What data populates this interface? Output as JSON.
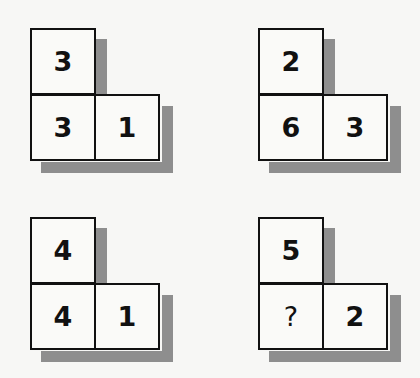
{
  "puzzle": {
    "figures": [
      {
        "top": "3",
        "bottom_left": "3",
        "bottom_right": "1"
      },
      {
        "top": "2",
        "bottom_left": "6",
        "bottom_right": "3"
      },
      {
        "top": "4",
        "bottom_left": "4",
        "bottom_right": "1"
      },
      {
        "top": "5",
        "bottom_left": "?",
        "bottom_right": "2"
      }
    ]
  }
}
